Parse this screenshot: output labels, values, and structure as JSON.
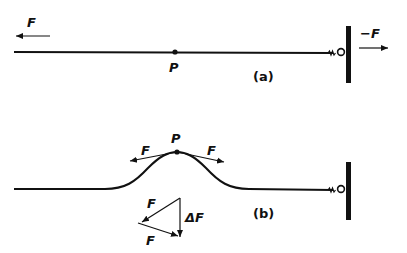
{
  "panel_a": {
    "caption": "(a)",
    "point_label": "P",
    "left_force_label": "F",
    "right_force_label": "−F"
  },
  "panel_b": {
    "caption": "(b)",
    "point_label": "P",
    "left_force_label": "F",
    "right_force_label": "F",
    "triangle_labels": {
      "top": "F",
      "bottom": "F",
      "delta": "ΔF"
    }
  },
  "colors": {
    "ink": "#111111",
    "background": "#ffffff"
  }
}
